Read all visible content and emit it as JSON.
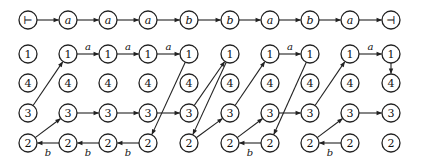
{
  "diagram": {
    "title": "",
    "columns_x": [
      28,
      68,
      108,
      148,
      189,
      230,
      270,
      310,
      350,
      391
    ],
    "tape_y": 20,
    "row_y": {
      "1": 54,
      "4": 83,
      "3": 113,
      "2": 143
    },
    "row_order": [
      "1",
      "4",
      "3",
      "2"
    ],
    "tape": [
      "⊢",
      "a",
      "a",
      "a",
      "b",
      "b",
      "a",
      "b",
      "a",
      "⊣"
    ],
    "grid_labels": [
      "1",
      "4",
      "3",
      "2"
    ],
    "edges": [
      {
        "from": [
          0,
          "3"
        ],
        "to": [
          1,
          "1"
        ],
        "label": ""
      },
      {
        "from": [
          1,
          "1"
        ],
        "to": [
          2,
          "1"
        ],
        "label": "a"
      },
      {
        "from": [
          2,
          "1"
        ],
        "to": [
          3,
          "1"
        ],
        "label": "a"
      },
      {
        "from": [
          3,
          "1"
        ],
        "to": [
          4,
          "1"
        ],
        "label": "a"
      },
      {
        "from": [
          4,
          "1"
        ],
        "to": [
          3,
          "2"
        ],
        "label": ""
      },
      {
        "from": [
          1,
          "3"
        ],
        "to": [
          2,
          "3"
        ],
        "label": ""
      },
      {
        "from": [
          2,
          "3"
        ],
        "to": [
          3,
          "3"
        ],
        "label": ""
      },
      {
        "from": [
          3,
          "3"
        ],
        "to": [
          4,
          "3"
        ],
        "label": ""
      },
      {
        "from": [
          0,
          "2"
        ],
        "to": [
          1,
          "3"
        ],
        "label": ""
      },
      {
        "from": [
          1,
          "2"
        ],
        "to": [
          0,
          "2"
        ],
        "label": "b"
      },
      {
        "from": [
          2,
          "2"
        ],
        "to": [
          1,
          "2"
        ],
        "label": "b"
      },
      {
        "from": [
          3,
          "2"
        ],
        "to": [
          2,
          "2"
        ],
        "label": "b"
      },
      {
        "from": [
          4,
          "3"
        ],
        "to": [
          5,
          "1"
        ],
        "label": ""
      },
      {
        "from": [
          5,
          "1"
        ],
        "to": [
          4,
          "2"
        ],
        "label": ""
      },
      {
        "from": [
          4,
          "2"
        ],
        "to": [
          5,
          "3"
        ],
        "label": ""
      },
      {
        "from": [
          5,
          "3"
        ],
        "to": [
          6,
          "1"
        ],
        "label": ""
      },
      {
        "from": [
          6,
          "1"
        ],
        "to": [
          7,
          "1"
        ],
        "label": "a"
      },
      {
        "from": [
          7,
          "1"
        ],
        "to": [
          6,
          "2"
        ],
        "label": ""
      },
      {
        "from": [
          5,
          "2"
        ],
        "to": [
          6,
          "3"
        ],
        "label": ""
      },
      {
        "from": [
          6,
          "2"
        ],
        "to": [
          5,
          "2"
        ],
        "label": "b"
      },
      {
        "from": [
          6,
          "3"
        ],
        "to": [
          7,
          "3"
        ],
        "label": ""
      },
      {
        "from": [
          7,
          "3"
        ],
        "to": [
          8,
          "1"
        ],
        "label": ""
      },
      {
        "from": [
          8,
          "1"
        ],
        "to": [
          9,
          "1"
        ],
        "label": "a"
      },
      {
        "from": [
          9,
          "1"
        ],
        "to": [
          9,
          "4"
        ],
        "label": ""
      },
      {
        "from": [
          7,
          "2"
        ],
        "to": [
          8,
          "3"
        ],
        "label": ""
      },
      {
        "from": [
          8,
          "2"
        ],
        "to": [
          7,
          "2"
        ],
        "label": "b"
      },
      {
        "from": [
          8,
          "3"
        ],
        "to": [
          9,
          "3"
        ],
        "label": ""
      }
    ],
    "node_radius": 9,
    "colors": {
      "stroke": "#222222",
      "background": "#ffffff"
    }
  }
}
